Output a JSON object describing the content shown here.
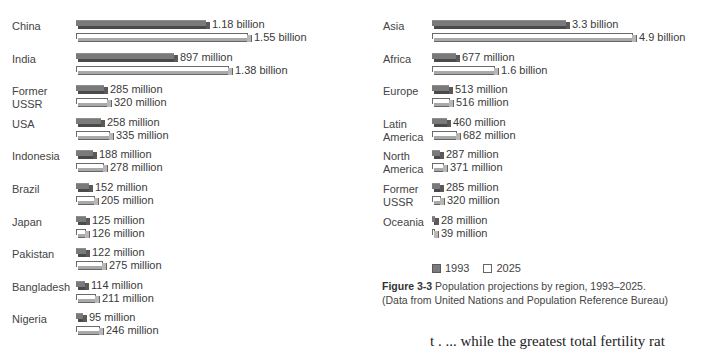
{
  "figure": {
    "number_label": "Figure 3-3",
    "caption_text": "Population projections by region, 1993–2025.",
    "caption_source": "(Data from United Nations and Population Reference Bureau)"
  },
  "legend": {
    "items": [
      {
        "label": "1993",
        "color": "#7a7a7a"
      },
      {
        "label": "2025",
        "color": "#ffffff"
      }
    ]
  },
  "cutoff_text": "t     .          ...  while the greatest total fertility rat",
  "chart_data": [
    {
      "type": "bar",
      "orientation": "horizontal",
      "title": "Population by country, 1993 and 2025 (projected)",
      "xlabel": "",
      "ylabel": "",
      "grid": false,
      "legend_position": "bottom-right (shared)",
      "categories": [
        "China",
        "India",
        "Former\nUSSR",
        "USA",
        "Indonesia",
        "Brazil",
        "Japan",
        "Pakistan",
        "Bangladesh",
        "Nigeria"
      ],
      "series": [
        {
          "name": "1993",
          "values": [
            1180,
            897,
            285,
            258,
            188,
            152,
            125,
            122,
            114,
            95
          ],
          "unit": "million",
          "labels": [
            "1.18 billion",
            "897 million",
            "285 million",
            "258 million",
            "188 million",
            "152 million",
            "125 million",
            "122 million",
            "114 million",
            "95 million"
          ]
        },
        {
          "name": "2025",
          "values": [
            1550,
            1380,
            320,
            335,
            278,
            205,
            126,
            275,
            211,
            246
          ],
          "unit": "million",
          "labels": [
            "1.55 billion",
            "1.38 billion",
            "320 million",
            "335 million",
            "278 million",
            "205 million",
            "126 million",
            "275 million",
            "211 million",
            "246 million"
          ]
        }
      ]
    },
    {
      "type": "bar",
      "orientation": "horizontal",
      "title": "Population projections by region, 1993–2025",
      "xlabel": "",
      "ylabel": "",
      "grid": false,
      "legend_position": "bottom",
      "categories": [
        "Asia",
        "Africa",
        "Europe",
        "Latin\nAmerica",
        "North\nAmerica",
        "Former\nUSSR",
        "Oceania"
      ],
      "series": [
        {
          "name": "1993",
          "values": [
            3300,
            677,
            513,
            460,
            287,
            285,
            28
          ],
          "unit": "million",
          "labels": [
            "3.3 billion",
            "677 million",
            "513 million",
            "460 million",
            "287 million",
            "285 million",
            "28 million"
          ]
        },
        {
          "name": "2025",
          "values": [
            4900,
            1600,
            516,
            682,
            371,
            320,
            39
          ],
          "unit": "million",
          "labels": [
            "4.9 billion",
            "1.6 billion",
            "516 million",
            "682 million",
            "371 million",
            "320 million",
            "39 million"
          ]
        }
      ]
    }
  ]
}
